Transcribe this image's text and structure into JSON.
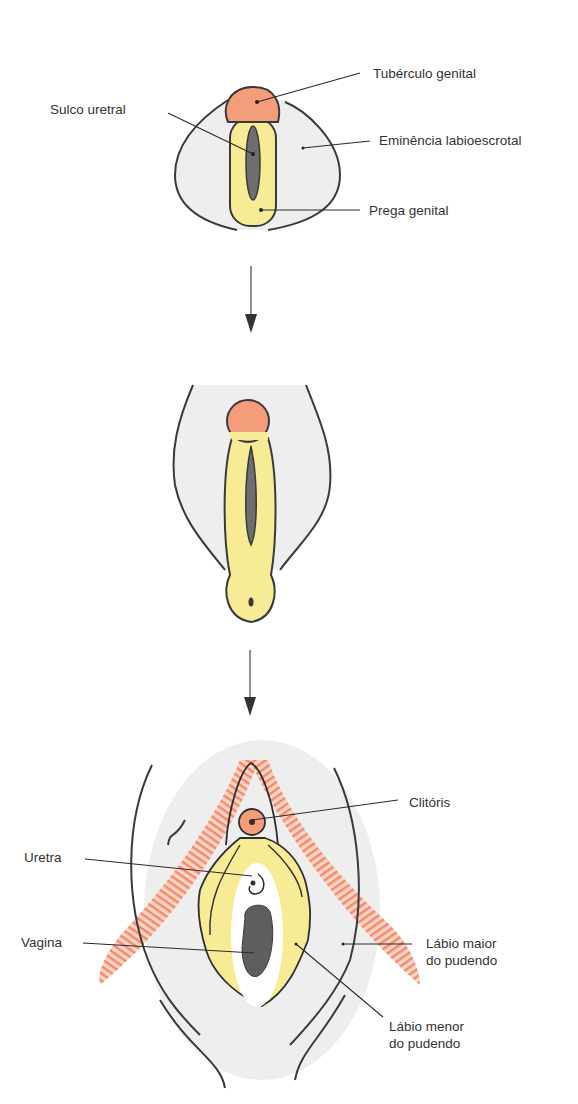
{
  "diagram": {
    "title": "",
    "colors": {
      "tubercle": "#f39d7a",
      "fold": "#f8eb96",
      "groove": "#6e6e6e",
      "skin": "#eeeeee",
      "muscle_stripe": "#f08a6c",
      "outline": "#3a3a3a"
    },
    "stages": [
      {
        "id": "stage-1",
        "labels": {
          "tuberculo_genital": "Tubérculo genital",
          "sulco_uretral": "Sulco uretral",
          "eminencia_labioescrotal": "Eminência labioescrotal",
          "prega_genital": "Prega genital"
        }
      },
      {
        "id": "stage-2",
        "labels": {}
      },
      {
        "id": "stage-3",
        "labels": {
          "clitoris": "Clitóris",
          "uretra": "Uretra",
          "vagina": "Vagina",
          "labio_maior_l1": "Lábio maior",
          "labio_maior_l2": "do pudendo",
          "labio_menor_l1": "Lábio menor",
          "labio_menor_l2": "do pudendo"
        }
      }
    ],
    "arrows": [
      {
        "id": "arrow-1",
        "direction": "down"
      },
      {
        "id": "arrow-2",
        "direction": "down"
      }
    ]
  }
}
